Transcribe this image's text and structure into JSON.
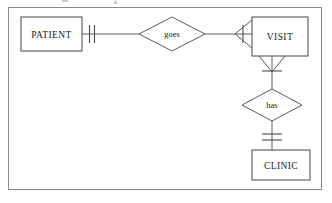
{
  "diagram": {
    "type": "entity-relationship-diagram",
    "notation": "crow's foot",
    "background_color": "#ffffff",
    "line_color": "#5a5a62",
    "text_color": "#1a1a1a",
    "frame": {
      "x": 8,
      "y": 7,
      "width": 314,
      "height": 183
    },
    "entities": [
      {
        "id": "patient",
        "label": "PATIENT",
        "x": 21,
        "y": 17,
        "width": 61,
        "height": 34
      },
      {
        "id": "visit",
        "label": "VISIT",
        "x": 252,
        "y": 17,
        "width": 56,
        "height": 39
      },
      {
        "id": "clinic",
        "label": "CLINIC",
        "x": 252,
        "y": 150,
        "width": 58,
        "height": 30
      }
    ],
    "relationships": [
      {
        "id": "goes",
        "label": "goes",
        "cx": 172,
        "cy": 34,
        "rx": 33,
        "ry": 17,
        "from": "patient",
        "to": "visit",
        "from_cardinality": "exactly-one",
        "to_cardinality": "one-or-many"
      },
      {
        "id": "has",
        "label": "has",
        "cx": 272,
        "cy": 105,
        "rx": 30,
        "ry": 16,
        "from": "visit",
        "to": "clinic",
        "from_cardinality": "one-or-many",
        "to_cardinality": "exactly-one"
      }
    ]
  }
}
